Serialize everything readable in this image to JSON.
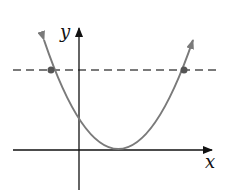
{
  "diagram": {
    "type": "function-graph",
    "axes": {
      "x_label": "x",
      "y_label": "y"
    },
    "curve": {
      "kind": "parabola",
      "opens": "up",
      "vertex_on_x_axis": true,
      "color": "#7a7a7a"
    },
    "horizontal_line": {
      "style": "dashed",
      "color": "#7a7a7a",
      "intersections": 2
    },
    "colors": {
      "axis": "#111111",
      "curve": "#7a7a7a",
      "dashed_line": "#7a7a7a",
      "points": "#555555"
    }
  }
}
